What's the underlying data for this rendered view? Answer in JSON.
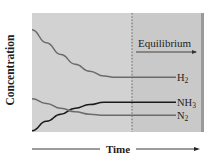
{
  "chart_data": {
    "type": "line",
    "title": "",
    "xlabel": "Time",
    "ylabel": "Concentration",
    "annotation": "Equilibrium",
    "equilibrium_x": 0.58,
    "x": [
      0,
      0.1,
      0.2,
      0.3,
      0.4,
      0.5,
      0.58,
      0.7,
      0.85,
      1.0
    ],
    "series": [
      {
        "name": "H2",
        "label": "H",
        "subscript": "2",
        "color": "#6b6b6b",
        "values": [
          0.86,
          0.75,
          0.65,
          0.57,
          0.51,
          0.47,
          0.46,
          0.46,
          0.46,
          0.46
        ]
      },
      {
        "name": "NH3",
        "label": "NH",
        "subscript": "3",
        "color": "#1a1a1a",
        "values": [
          0.01,
          0.09,
          0.15,
          0.2,
          0.23,
          0.25,
          0.25,
          0.25,
          0.25,
          0.25
        ]
      },
      {
        "name": "N2",
        "label": "N",
        "subscript": "2",
        "color": "#6b6b6b",
        "values": [
          0.28,
          0.24,
          0.2,
          0.17,
          0.15,
          0.14,
          0.14,
          0.14,
          0.14,
          0.14
        ]
      }
    ],
    "ylim": [
      0,
      1
    ],
    "xlim": [
      0,
      1
    ],
    "grid": false,
    "legend": "inline-right",
    "colors": {
      "plot_bg": "#d2d2d2",
      "equilibrium_bg": "#c9c9c9",
      "edge": "#9a9a9a",
      "dashed_line": "#7a7a7a"
    }
  }
}
